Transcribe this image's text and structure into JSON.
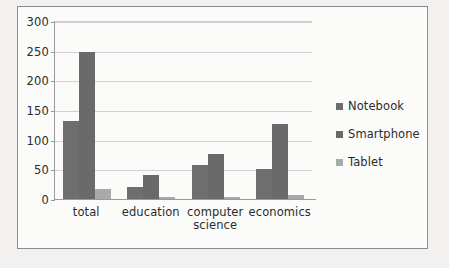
{
  "chart_data": {
    "type": "bar",
    "title": "",
    "xlabel": "",
    "ylabel": "",
    "ylim": [
      0,
      300
    ],
    "yticks": [
      0,
      50,
      100,
      150,
      200,
      250,
      300
    ],
    "grid": true,
    "legend_position": "right",
    "categories": [
      "total",
      "education",
      "computer science",
      "economics"
    ],
    "series": [
      {
        "name": "Notebook",
        "color": "#6e6e6e",
        "values": [
          132,
          20,
          58,
          50
        ]
      },
      {
        "name": "Smartphone",
        "color": "#6a6a6a",
        "values": [
          248,
          40,
          76,
          126
        ]
      },
      {
        "name": "Tablet",
        "color": "#a9a9a9",
        "values": [
          17,
          3,
          3,
          7
        ]
      }
    ]
  },
  "legend": {
    "items": [
      {
        "label": "Notebook"
      },
      {
        "label": "Smartphone"
      },
      {
        "label": "Tablet"
      }
    ]
  },
  "caption": ""
}
